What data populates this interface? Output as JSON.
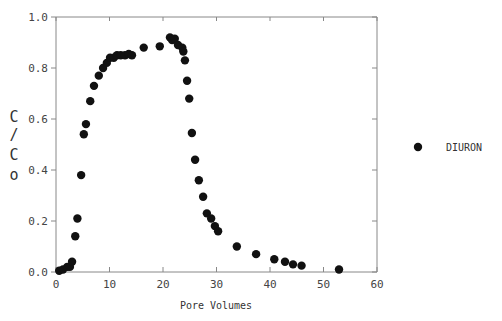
{
  "chart_data": {
    "type": "scatter",
    "title": "",
    "xlabel": "Pore Volumes",
    "ylabel": "C/Co",
    "ylabel_chars": [
      "C",
      "/",
      "C",
      "o"
    ],
    "xlim": [
      0,
      60
    ],
    "ylim": [
      0.0,
      1.0
    ],
    "x_ticks": [
      0,
      10,
      20,
      30,
      40,
      50,
      60
    ],
    "x_tick_labels": [
      "0",
      "10",
      "20",
      "30",
      "40",
      "50",
      "60"
    ],
    "y_ticks": [
      0.0,
      0.2,
      0.4,
      0.6,
      0.8,
      1.0
    ],
    "y_tick_labels": [
      "0.0",
      "0.2",
      "0.4",
      "0.6",
      "0.8",
      "1.0"
    ],
    "grid": false,
    "legend_position": "right",
    "marker_color": "#111111",
    "axis_color": "#888888",
    "series": [
      {
        "name": "DIURON",
        "marker": "filled-circle",
        "x": [
          0.6,
          1.3,
          2.1,
          2.6,
          3.0,
          3.6,
          4.0,
          4.7,
          5.2,
          5.6,
          6.4,
          7.1,
          8.0,
          8.8,
          9.5,
          10.1,
          10.8,
          11.4,
          12.1,
          12.9,
          13.6,
          14.2,
          16.4,
          19.4,
          21.3,
          21.7,
          22.2,
          22.8,
          23.6,
          23.8,
          24.1,
          24.5,
          24.9,
          25.4,
          26.0,
          26.7,
          27.5,
          28.2,
          29.0,
          29.7,
          30.3,
          33.8,
          37.4,
          40.8,
          42.8,
          44.3,
          45.9,
          52.9
        ],
        "y": [
          0.005,
          0.01,
          0.02,
          0.02,
          0.04,
          0.14,
          0.21,
          0.38,
          0.54,
          0.58,
          0.67,
          0.73,
          0.77,
          0.8,
          0.82,
          0.84,
          0.84,
          0.85,
          0.85,
          0.85,
          0.855,
          0.85,
          0.88,
          0.885,
          0.92,
          0.91,
          0.915,
          0.89,
          0.88,
          0.865,
          0.83,
          0.75,
          0.68,
          0.545,
          0.44,
          0.36,
          0.295,
          0.23,
          0.21,
          0.18,
          0.16,
          0.1,
          0.07,
          0.05,
          0.04,
          0.03,
          0.025,
          0.01
        ]
      }
    ]
  },
  "legend": {
    "items": [
      {
        "label": "DIURON",
        "marker": "filled-circle"
      }
    ]
  }
}
